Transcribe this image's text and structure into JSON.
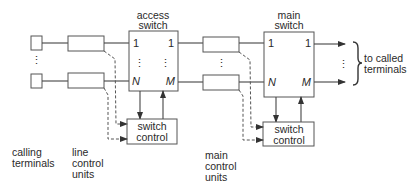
{
  "diagram": {
    "type": "block-diagram",
    "blocks": {
      "access_switch": {
        "label_line1": "access",
        "label_line2": "switch",
        "in_top": "1",
        "in_bottom": "N",
        "out_top": "1",
        "out_bottom": "M",
        "dots": "⋮"
      },
      "main_switch": {
        "label_line1": "main",
        "label_line2": "switch",
        "in_top": "1",
        "in_bottom": "N",
        "out_top": "1",
        "out_bottom": "M",
        "dots": "⋮"
      },
      "switch_control_1": {
        "line1": "switch",
        "line2": "control"
      },
      "switch_control_2": {
        "line1": "switch",
        "line2": "control"
      }
    },
    "labels": {
      "calling_terminals": [
        "calling",
        "terminals"
      ],
      "line_control_units": [
        "line",
        "control",
        "units"
      ],
      "main_control_units": [
        "main",
        "control",
        "units"
      ],
      "to_called_terminals": [
        "to called",
        "terminals"
      ]
    },
    "dots": "⋮"
  }
}
